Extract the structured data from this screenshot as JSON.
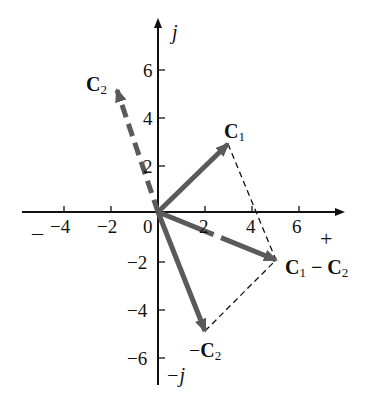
{
  "diagram": {
    "title": "",
    "axes": {
      "x_positive_label": "+",
      "x_negative_label": "–",
      "y_positive_label": "j",
      "y_negative_label": "−j",
      "x_ticks": [
        "−4",
        "−2",
        "0",
        "2",
        "4",
        "6"
      ],
      "y_ticks": [
        "6",
        "4",
        "2",
        "−2",
        "−4",
        "−6"
      ]
    },
    "vectors": [
      {
        "name": "C",
        "sub": "1",
        "prefix": "",
        "suffix": "",
        "sub2": "",
        "x": 3,
        "y": 3,
        "style": "solid"
      },
      {
        "name": "C",
        "sub": "2",
        "prefix": "",
        "suffix": "",
        "sub2": "",
        "x": -2,
        "y": 5,
        "style": "dashed"
      },
      {
        "name": "C",
        "sub": "2",
        "prefix": "−",
        "suffix": "",
        "sub2": "",
        "x": 2,
        "y": -5,
        "style": "solid"
      },
      {
        "name": "C",
        "sub": "1",
        "prefix": "",
        "suffix": " − C",
        "sub2": "2",
        "x": 5,
        "y": -2,
        "style": "solid"
      }
    ],
    "colors": {
      "axis": "#111111",
      "vector": "#5a5a5a",
      "construction": "#111111"
    }
  }
}
